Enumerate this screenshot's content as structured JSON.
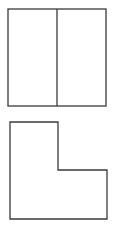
{
  "colors": {
    "stroke": "#3a3a3a",
    "background": "#ffffff"
  },
  "shapes": {
    "divided_square": {
      "x": 8,
      "y": 9,
      "width": 98,
      "height": 97,
      "divider_x": 57
    },
    "l_shape": {
      "points": "10,122 58,122 58,170 107,170 107,219 10,219"
    }
  }
}
